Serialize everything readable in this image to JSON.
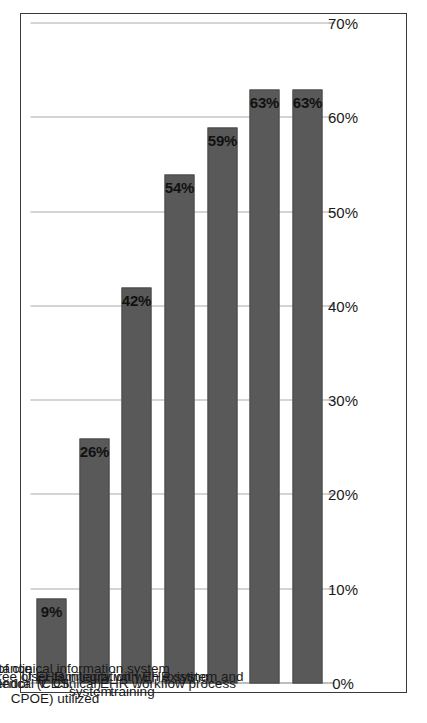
{
  "chart_data": {
    "type": "bar",
    "orientation": "horizontal",
    "title": "",
    "subtitle": "",
    "xlabel": "",
    "ylabel": "",
    "categories": [
      "Contractual protection (acceptance testing or\nuptime guarantees)",
      "Reliability of EHR vendor",
      "Types of users (Clerical V. Clinical)",
      "Features of clinical information system (CDS,\nCPOE) utilized",
      "Degree of EHR integration with existing system",
      "User familiarity with EHR system and training",
      "EHR workflow process"
    ],
    "values": [
      9,
      26,
      42,
      54,
      59,
      63,
      63
    ],
    "value_labels": [
      "9%",
      "26%",
      "42%",
      "54%",
      "59%",
      "63%",
      "63%"
    ],
    "xlim": [
      0,
      70
    ],
    "tick_values": [
      0,
      10,
      20,
      30,
      40,
      50,
      60,
      70
    ],
    "tick_labels": [
      "0%",
      "10%",
      "20%",
      "30%",
      "40%",
      "50%",
      "60%",
      "70%"
    ],
    "grid": true,
    "grid_axis": "value",
    "legend": false,
    "legend_position": "none",
    "bar_color": "#595959",
    "grid_color": "#a9a9a9",
    "axis_color": "#7f7f7f",
    "frame_color": "#3a3a3a",
    "background": "#ffffff"
  }
}
